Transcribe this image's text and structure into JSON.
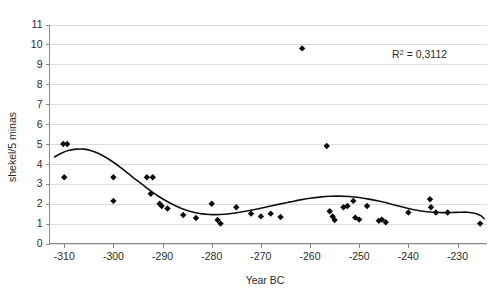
{
  "chart_data": {
    "type": "scatter",
    "title": "",
    "subtitle": "",
    "xlabel": "Year BC",
    "ylabel": "shekel/5 minas",
    "xlim": [
      -313,
      -224
    ],
    "ylim": [
      0,
      11
    ],
    "xticks": [
      -310,
      -300,
      -290,
      -280,
      -270,
      -260,
      -250,
      -240,
      -230
    ],
    "xtick_labels": [
      "-310",
      "-300",
      "-290",
      "-280",
      "-270",
      "-260",
      "-250",
      "-240",
      "-230"
    ],
    "yticks": [
      0,
      1,
      2,
      3,
      4,
      5,
      6,
      7,
      8,
      9,
      10,
      11
    ],
    "ytick_labels": [
      "0",
      "1",
      "2",
      "3",
      "4",
      "5",
      "6",
      "7",
      "8",
      "9",
      "10",
      "11"
    ],
    "grid": "horizontal",
    "legend": "none",
    "annotations": [
      {
        "name": "r-squared",
        "text": "R2 = 0,3112",
        "text_base": "R",
        "text_sup": "2",
        "text_rest": " = 0,3112",
        "x": -243,
        "y": 9.2
      }
    ],
    "marker": "diamond",
    "marker_color": "#0d0d0d",
    "marker_size": 3.2,
    "points": [
      {
        "x": -310.2,
        "y": 5.0
      },
      {
        "x": -309.4,
        "y": 5.0
      },
      {
        "x": -310.0,
        "y": 3.33
      },
      {
        "x": -300.0,
        "y": 3.33
      },
      {
        "x": -300.0,
        "y": 2.14
      },
      {
        "x": -293.2,
        "y": 3.33
      },
      {
        "x": -292.0,
        "y": 3.33
      },
      {
        "x": -292.4,
        "y": 2.5
      },
      {
        "x": -290.6,
        "y": 2.0
      },
      {
        "x": -290.2,
        "y": 1.88
      },
      {
        "x": -289.0,
        "y": 1.76
      },
      {
        "x": -285.8,
        "y": 1.43
      },
      {
        "x": -283.2,
        "y": 1.28
      },
      {
        "x": -280.0,
        "y": 2.0
      },
      {
        "x": -278.8,
        "y": 1.18
      },
      {
        "x": -278.2,
        "y": 1.0
      },
      {
        "x": -275.0,
        "y": 1.82
      },
      {
        "x": -272.0,
        "y": 1.5
      },
      {
        "x": -270.0,
        "y": 1.36
      },
      {
        "x": -268.0,
        "y": 1.5
      },
      {
        "x": -266.0,
        "y": 1.33
      },
      {
        "x": -261.6,
        "y": 9.8
      },
      {
        "x": -256.6,
        "y": 4.9
      },
      {
        "x": -256.0,
        "y": 1.62
      },
      {
        "x": -255.4,
        "y": 1.36
      },
      {
        "x": -255.0,
        "y": 1.18
      },
      {
        "x": -253.2,
        "y": 1.82
      },
      {
        "x": -252.4,
        "y": 1.88
      },
      {
        "x": -251.2,
        "y": 2.14
      },
      {
        "x": -250.8,
        "y": 1.3
      },
      {
        "x": -250.0,
        "y": 1.2
      },
      {
        "x": -248.4,
        "y": 1.88
      },
      {
        "x": -246.0,
        "y": 1.14
      },
      {
        "x": -245.4,
        "y": 1.2
      },
      {
        "x": -244.6,
        "y": 1.07
      },
      {
        "x": -240.0,
        "y": 1.56
      },
      {
        "x": -235.6,
        "y": 2.22
      },
      {
        "x": -235.4,
        "y": 1.82
      },
      {
        "x": -234.4,
        "y": 1.56
      },
      {
        "x": -232.0,
        "y": 1.56
      },
      {
        "x": -225.4,
        "y": 1.0
      }
    ],
    "trend_name": "polynomial-trendline",
    "trend_points": [
      {
        "x": -312.0,
        "y": 4.35
      },
      {
        "x": -310.5,
        "y": 4.55
      },
      {
        "x": -309.0,
        "y": 4.68
      },
      {
        "x": -307.5,
        "y": 4.74
      },
      {
        "x": -306.0,
        "y": 4.74
      },
      {
        "x": -304.5,
        "y": 4.66
      },
      {
        "x": -303.0,
        "y": 4.52
      },
      {
        "x": -301.5,
        "y": 4.32
      },
      {
        "x": -300.0,
        "y": 4.08
      },
      {
        "x": -298.5,
        "y": 3.81
      },
      {
        "x": -297.0,
        "y": 3.52
      },
      {
        "x": -295.5,
        "y": 3.22
      },
      {
        "x": -294.0,
        "y": 2.94
      },
      {
        "x": -292.5,
        "y": 2.66
      },
      {
        "x": -291.0,
        "y": 2.4
      },
      {
        "x": -289.5,
        "y": 2.17
      },
      {
        "x": -288.0,
        "y": 1.97
      },
      {
        "x": -286.5,
        "y": 1.8
      },
      {
        "x": -285.0,
        "y": 1.66
      },
      {
        "x": -283.5,
        "y": 1.56
      },
      {
        "x": -282.0,
        "y": 1.49
      },
      {
        "x": -280.5,
        "y": 1.46
      },
      {
        "x": -279.0,
        "y": 1.45
      },
      {
        "x": -277.5,
        "y": 1.47
      },
      {
        "x": -276.0,
        "y": 1.51
      },
      {
        "x": -274.0,
        "y": 1.58
      },
      {
        "x": -272.0,
        "y": 1.67
      },
      {
        "x": -270.0,
        "y": 1.77
      },
      {
        "x": -268.0,
        "y": 1.88
      },
      {
        "x": -266.0,
        "y": 1.99
      },
      {
        "x": -264.0,
        "y": 2.09
      },
      {
        "x": -262.0,
        "y": 2.19
      },
      {
        "x": -260.0,
        "y": 2.27
      },
      {
        "x": -258.0,
        "y": 2.33
      },
      {
        "x": -256.0,
        "y": 2.37
      },
      {
        "x": -254.0,
        "y": 2.38
      },
      {
        "x": -252.0,
        "y": 2.36
      },
      {
        "x": -250.0,
        "y": 2.31
      },
      {
        "x": -248.0,
        "y": 2.23
      },
      {
        "x": -246.0,
        "y": 2.13
      },
      {
        "x": -244.0,
        "y": 2.01
      },
      {
        "x": -242.0,
        "y": 1.88
      },
      {
        "x": -240.0,
        "y": 1.76
      },
      {
        "x": -238.5,
        "y": 1.68
      },
      {
        "x": -237.0,
        "y": 1.62
      },
      {
        "x": -235.5,
        "y": 1.58
      },
      {
        "x": -234.0,
        "y": 1.56
      },
      {
        "x": -232.5,
        "y": 1.55
      },
      {
        "x": -231.0,
        "y": 1.56
      },
      {
        "x": -229.5,
        "y": 1.57
      },
      {
        "x": -228.0,
        "y": 1.57
      },
      {
        "x": -226.5,
        "y": 1.52
      },
      {
        "x": -225.5,
        "y": 1.43
      },
      {
        "x": -225.0,
        "y": 1.35
      },
      {
        "x": -224.6,
        "y": 1.25
      }
    ]
  }
}
